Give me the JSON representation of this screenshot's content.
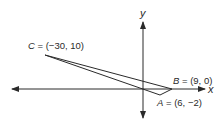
{
  "diagram": {
    "axes": {
      "x_label": "x",
      "y_label": "y"
    },
    "points": {
      "A": {
        "name": "A",
        "coords": "(6, −2)",
        "label_rest": " = (6, −2)"
      },
      "B": {
        "name": "B",
        "coords": "(9, 0)",
        "label_rest": " = (9, 0)"
      },
      "C": {
        "name": "C",
        "coords": "(−30, 10)",
        "label_rest": " = (−30, 10)"
      }
    },
    "colors": {
      "line": "#2a2a2a",
      "background": "#ffffff"
    }
  }
}
